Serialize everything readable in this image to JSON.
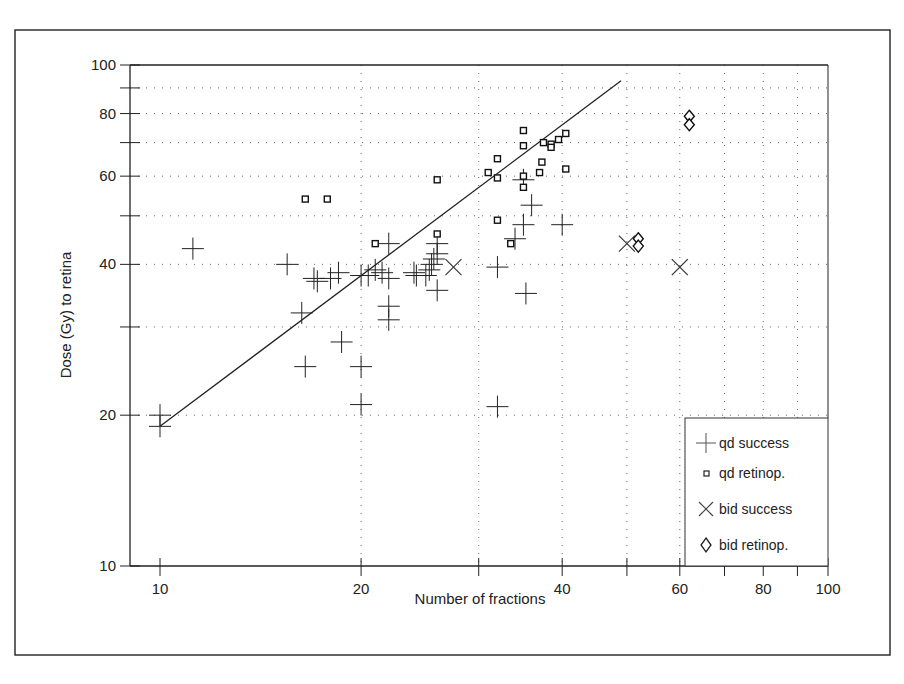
{
  "chart_data": {
    "type": "scatter",
    "title": "",
    "xlabel": "Number of fractions",
    "ylabel": "Dose (Gy) to retina",
    "xscale": "log",
    "yscale": "log",
    "xlim": [
      9,
      100
    ],
    "ylim": [
      10,
      100
    ],
    "x_ticks": [
      10,
      20,
      40,
      60,
      80,
      100
    ],
    "y_ticks": [
      10,
      20,
      40,
      60,
      80,
      100
    ],
    "x_minor_ticks": [
      30,
      50,
      70,
      90
    ],
    "y_minor_ticks": [
      30,
      50,
      70,
      90
    ],
    "grid": true,
    "legend_position": "lower right",
    "legend": [
      "qd success",
      "qd retinop.",
      "bid success",
      "bid retinop."
    ],
    "series": [
      {
        "name": "qd success",
        "marker": "plus",
        "points": [
          [
            10,
            20
          ],
          [
            10,
            19
          ],
          [
            11.2,
            43
          ],
          [
            15.5,
            40
          ],
          [
            16.3,
            32
          ],
          [
            16.5,
            25
          ],
          [
            17,
            37.5
          ],
          [
            17.2,
            37
          ],
          [
            18,
            37.5
          ],
          [
            18.5,
            38.5
          ],
          [
            18.7,
            28
          ],
          [
            20,
            21
          ],
          [
            20,
            25
          ],
          [
            20,
            38
          ],
          [
            20.5,
            38
          ],
          [
            21,
            39
          ],
          [
            21.5,
            38.5
          ],
          [
            22,
            44
          ],
          [
            22,
            37.5
          ],
          [
            22,
            33
          ],
          [
            22,
            31
          ],
          [
            24,
            38.5
          ],
          [
            24.2,
            38
          ],
          [
            25,
            38
          ],
          [
            25.3,
            39
          ],
          [
            25.5,
            40
          ],
          [
            25.7,
            41
          ],
          [
            26,
            42
          ],
          [
            26,
            44
          ],
          [
            26,
            35.5
          ],
          [
            32,
            39.5
          ],
          [
            32,
            20.8
          ],
          [
            34,
            45
          ],
          [
            35,
            48
          ],
          [
            35.3,
            35
          ],
          [
            36,
            52.5
          ],
          [
            35,
            59
          ],
          [
            40,
            48
          ]
        ]
      },
      {
        "name": "qd retinop.",
        "marker": "square",
        "points": [
          [
            16.5,
            54
          ],
          [
            17.8,
            54
          ],
          [
            21,
            44
          ],
          [
            26,
            46
          ],
          [
            26,
            59
          ],
          [
            31,
            61
          ],
          [
            32,
            59.5
          ],
          [
            32,
            65
          ],
          [
            32,
            49
          ],
          [
            33.5,
            44
          ],
          [
            35,
            74
          ],
          [
            35,
            69
          ],
          [
            35,
            60
          ],
          [
            35,
            57
          ],
          [
            37,
            61
          ],
          [
            37.3,
            64
          ],
          [
            37.5,
            70
          ],
          [
            38.5,
            69.5
          ],
          [
            38.5,
            68.5
          ],
          [
            39.5,
            71
          ],
          [
            40.5,
            73
          ],
          [
            40.5,
            62
          ]
        ]
      },
      {
        "name": "bid success",
        "marker": "x",
        "points": [
          [
            27.5,
            39.5
          ],
          [
            50,
            44
          ],
          [
            60,
            39.5
          ]
        ]
      },
      {
        "name": "bid retinop.",
        "marker": "diamond",
        "points": [
          [
            52,
            45
          ],
          [
            52,
            43.5
          ],
          [
            62,
            79
          ],
          [
            62,
            76
          ]
        ]
      }
    ],
    "fit_line": {
      "from": [
        10,
        19
      ],
      "to": [
        49,
        93
      ]
    }
  },
  "labels": {
    "xlabel": "Number of fractions",
    "ylabel": "Dose (Gy) to retina",
    "legend": {
      "qd_success": "qd success",
      "qd_retinop": "qd retinop.",
      "bid_success": "bid success",
      "bid_retinop": "bid retinop."
    },
    "xticks": [
      "10",
      "20",
      "40",
      "60",
      "80",
      "100"
    ],
    "yticks": [
      "10",
      "20",
      "40",
      "60",
      "80",
      "100"
    ]
  }
}
